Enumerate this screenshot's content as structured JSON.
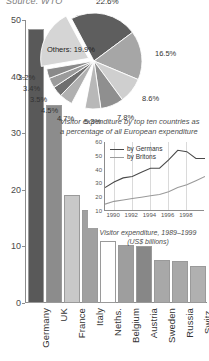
{
  "source_note": "Source: WTO",
  "pie_caption_line1": "Visitor expenditure by top ten countries as",
  "pie_caption_line2": "a percentage of all European expenditure",
  "inset_caption_line1": "Visitor expenditure, 1989–1999",
  "inset_caption_line2": "(US$ billions)",
  "colors": {
    "germany": "#595959",
    "uk": "#8c8c8c",
    "france": "#c8c8c8",
    "italy": "#a0a0a0",
    "neths": "#ffffff",
    "belgium": "#9e9e9e",
    "austria": "#878787",
    "sweden": "#a8a8a8",
    "russia": "#a8a8a8",
    "switz": "#b0b0b0",
    "axis": "#8d8d8d",
    "grid": "#dadada",
    "line_germans": "#4a4a4a",
    "line_britons": "#9a9a9a"
  },
  "chart_data": [
    {
      "type": "bar",
      "title": "",
      "xlabel": "",
      "ylabel": "",
      "ylim": [
        0,
        50
      ],
      "yticks": [
        "0",
        "10",
        "20",
        "30",
        "40",
        "50"
      ],
      "grid": false,
      "categories": [
        "Germany",
        "UK",
        "France",
        "Italy",
        "Neths.",
        "Belgium",
        "Austria",
        "Sweden",
        "Russia",
        "Switz."
      ],
      "values": [
        48.5,
        35.0,
        19.0,
        16.5,
        11.0,
        10.3,
        10.0,
        7.6,
        7.5,
        6.6
      ]
    },
    {
      "type": "pie",
      "title": "Visitor expenditure by top ten countries as a percentage of all European expenditure",
      "legend_position": "callout-labels",
      "labels": [
        "22.6%",
        "16.5%",
        "8.6%",
        "7.8%",
        "5.3%",
        "4.7%",
        "4.5%",
        "3.5%",
        "3.4%",
        "3.2%",
        "Others: 19.9%"
      ],
      "values": [
        22.6,
        16.5,
        8.6,
        7.8,
        5.3,
        4.7,
        4.5,
        3.5,
        3.4,
        3.2,
        19.9
      ],
      "slice_colors": [
        "#5e5e5e",
        "#a6a6a6",
        "#cfcfcf",
        "#8f8f8f",
        "#b8b8b8",
        "#ffffff",
        "#b0b0b0",
        "#6f6f6f",
        "#9b9b9b",
        "#8a8a8a",
        "#d5d5d5"
      ]
    },
    {
      "type": "line",
      "title": "Visitor expenditure, 1989–1999 (US$ billions)",
      "xlabel": "",
      "ylabel": "",
      "ylim": [
        10,
        60
      ],
      "yticks": [
        "10",
        "20",
        "30",
        "40",
        "50",
        "60"
      ],
      "xticks": [
        "1990",
        "1992",
        "1994",
        "1996",
        "1998"
      ],
      "grid": true,
      "legend_position": "top-left",
      "x": [
        1989,
        1990,
        1991,
        1992,
        1993,
        1994,
        1995,
        1996,
        1997,
        1998,
        1999
      ],
      "series": [
        {
          "name": "by Germans",
          "values": [
            27,
            31,
            34,
            35,
            38,
            41,
            41,
            47,
            54,
            53,
            48,
            48
          ]
        },
        {
          "name": "by Britons",
          "values": [
            15,
            17,
            18,
            19,
            20,
            21,
            22,
            24,
            27,
            29,
            32,
            35
          ]
        }
      ]
    }
  ]
}
